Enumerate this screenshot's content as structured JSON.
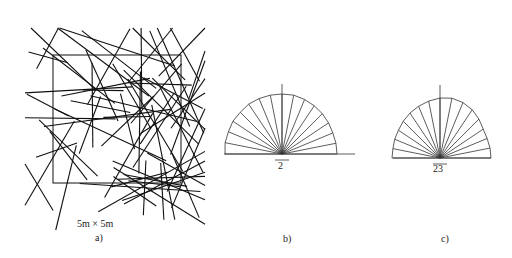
{
  "panels": {
    "a": {
      "label": "a)",
      "scale_text": "5m × 5m",
      "description": "random fracture trace network in 5m x 5m window"
    },
    "b": {
      "label": "b)",
      "count": "2",
      "description": "rose diagram of fracture orientations"
    },
    "c": {
      "label": "c)",
      "count": "23",
      "description": "rose diagram of fracture orientations"
    }
  },
  "colors": {
    "line": "#111111",
    "background": "#ffffff"
  }
}
